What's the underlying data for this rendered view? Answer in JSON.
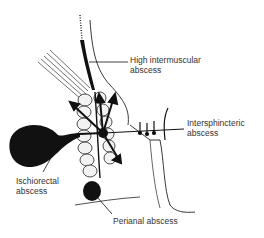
{
  "diagram": {
    "labels": {
      "high_intermuscular": {
        "line1": "High intermuscular",
        "line2": "abscess"
      },
      "intersphincteric": {
        "line1": "Intersphincteric",
        "line2": "abscess"
      },
      "ischiorectal": {
        "line1": "Ischiorectal",
        "line2": "abscess"
      },
      "perianal": {
        "line1": "Perianal abscess"
      }
    },
    "colors": {
      "ink": "#111111",
      "text": "#333333",
      "background": "#ffffff"
    }
  }
}
